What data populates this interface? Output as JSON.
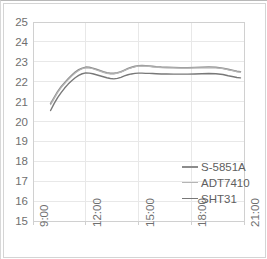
{
  "chart_data": {
    "type": "line",
    "title": "",
    "xlabel": "",
    "ylabel": "",
    "ylim": [
      15,
      25
    ],
    "ytick_labels": [
      "25",
      "24",
      "23",
      "22",
      "21",
      "20",
      "19",
      "18",
      "17",
      "16",
      "15"
    ],
    "ytick_values": [
      25,
      24,
      23,
      22,
      21,
      20,
      19,
      18,
      17,
      16,
      15
    ],
    "xlim": [
      "9:00",
      "21:00"
    ],
    "xtick_labels": [
      "9:00",
      "12:00",
      "15:00",
      "18:00",
      "21:00"
    ],
    "xtick_values": [
      9,
      12,
      15,
      18,
      21
    ],
    "grid": "horizontal",
    "legend_position": "inside-right",
    "x": [
      10.0,
      10.2,
      10.4,
      10.6,
      10.8,
      11.0,
      11.2,
      11.4,
      11.6,
      11.8,
      12.0,
      12.2,
      12.4,
      12.6,
      12.8,
      13.0,
      13.2,
      13.4,
      13.6,
      13.8,
      14.0,
      14.2,
      14.4,
      14.6,
      14.8,
      15.0,
      15.2,
      15.4,
      15.6,
      15.8,
      16.0,
      16.3,
      16.6,
      17.0,
      17.4,
      17.8,
      18.2,
      18.6,
      19.0,
      19.4,
      19.8,
      20.1,
      20.4,
      20.6,
      20.8
    ],
    "series": [
      {
        "name": "S-5851A",
        "color": "#8c8c8c",
        "width": 1.6,
        "values": [
          20.9,
          21.2,
          21.5,
          21.75,
          21.95,
          22.15,
          22.32,
          22.48,
          22.6,
          22.68,
          22.73,
          22.72,
          22.68,
          22.62,
          22.56,
          22.5,
          22.45,
          22.42,
          22.42,
          22.45,
          22.5,
          22.58,
          22.66,
          22.72,
          22.77,
          22.8,
          22.81,
          22.8,
          22.79,
          22.77,
          22.75,
          22.73,
          22.72,
          22.71,
          22.7,
          22.7,
          22.71,
          22.72,
          22.73,
          22.72,
          22.68,
          22.62,
          22.56,
          22.52,
          22.5
        ]
      },
      {
        "name": "ADT7410",
        "color": "#b5b5b5",
        "width": 1.2,
        "values": [
          20.85,
          21.15,
          21.45,
          21.7,
          21.9,
          22.1,
          22.28,
          22.44,
          22.56,
          22.65,
          22.7,
          22.69,
          22.65,
          22.59,
          22.53,
          22.47,
          22.42,
          22.39,
          22.39,
          22.43,
          22.48,
          22.56,
          22.64,
          22.7,
          22.75,
          22.78,
          22.79,
          22.78,
          22.77,
          22.75,
          22.73,
          22.71,
          22.7,
          22.69,
          22.68,
          22.68,
          22.69,
          22.7,
          22.71,
          22.7,
          22.66,
          22.6,
          22.54,
          22.5,
          22.48
        ]
      },
      {
        "name": "SHT31",
        "color": "#787878",
        "width": 1.4,
        "values": [
          20.55,
          20.9,
          21.2,
          21.45,
          21.68,
          21.88,
          22.05,
          22.2,
          22.32,
          22.4,
          22.44,
          22.43,
          22.4,
          22.35,
          22.3,
          22.25,
          22.2,
          22.16,
          22.14,
          22.17,
          22.22,
          22.29,
          22.35,
          22.39,
          22.42,
          22.43,
          22.43,
          22.42,
          22.42,
          22.41,
          22.4,
          22.39,
          22.39,
          22.38,
          22.38,
          22.38,
          22.39,
          22.4,
          22.41,
          22.4,
          22.36,
          22.3,
          22.25,
          22.21,
          22.19
        ]
      }
    ],
    "legend": [
      {
        "label": "S-5851A",
        "color": "#8c8c8c",
        "width": 2.2
      },
      {
        "label": "ADT7410",
        "color": "#b5b5b5",
        "width": 1.2
      },
      {
        "label": "SHT31",
        "color": "#787878",
        "width": 1.6
      }
    ]
  },
  "style": {
    "plot_background": "#ffffff",
    "gridline_color": "#e8e8e8",
    "axis_color": "#d0d0d0",
    "tick_text_color": "#6f6f6f",
    "legend_text_color": "#5e5e5e",
    "frame_color": "#d4d4d4"
  }
}
